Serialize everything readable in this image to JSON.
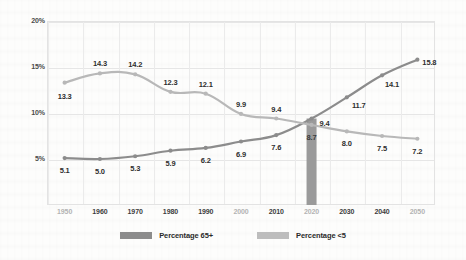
{
  "chart_data": {
    "type": "line",
    "title": "",
    "xlabel": "",
    "ylabel": "",
    "categories": [
      "1950",
      "1960",
      "1970",
      "1980",
      "1990",
      "2000",
      "2010",
      "2020",
      "2030",
      "2040",
      "2050"
    ],
    "series": [
      {
        "name": "Percentage 65+",
        "color": "#8c8c8c",
        "values": [
          5.1,
          5.0,
          5.3,
          5.9,
          6.2,
          6.9,
          7.6,
          9.4,
          11.7,
          14.1,
          15.8
        ]
      },
      {
        "name": "Percentage <5",
        "color": "#b8b8b8",
        "values": [
          13.3,
          14.3,
          14.2,
          12.3,
          12.1,
          9.9,
          9.4,
          8.7,
          8.0,
          7.5,
          7.2
        ]
      }
    ],
    "ylim": [
      0,
      20
    ],
    "yticks": [
      20,
      15,
      10,
      5
    ],
    "ytick_labels": [
      "20%",
      "15%",
      "10%",
      "5%"
    ],
    "grid": true,
    "legend_position": "bottom",
    "crossover_marker": {
      "category": "2020",
      "top_value": 9.4,
      "bar_label": "8.7",
      "color": "#9a9a9a"
    }
  },
  "axis": {
    "y_labels": [
      "20%",
      "15%",
      "10%",
      "5%"
    ],
    "x_labels": [
      {
        "text": "1950",
        "emphasis": "light"
      },
      {
        "text": "1960",
        "emphasis": "dark"
      },
      {
        "text": "1970",
        "emphasis": "dark"
      },
      {
        "text": "1980",
        "emphasis": "dark"
      },
      {
        "text": "1990",
        "emphasis": "dark"
      },
      {
        "text": "2000",
        "emphasis": "light"
      },
      {
        "text": "2010",
        "emphasis": "dark"
      },
      {
        "text": "2020",
        "emphasis": "light"
      },
      {
        "text": "2030",
        "emphasis": "dark"
      },
      {
        "text": "2040",
        "emphasis": "dark"
      },
      {
        "text": "2050",
        "emphasis": "light"
      }
    ]
  },
  "labels": {
    "series_65plus": [
      "5.1",
      "5.0",
      "5.3",
      "5.9",
      "6.2",
      "6.9",
      "7.6",
      "9.4",
      "11.7",
      "14.1",
      "15.8"
    ],
    "series_under5": [
      "13.3",
      "14.3",
      "14.2",
      "12.3",
      "12.1",
      "9.9",
      "9.4",
      "8.7",
      "8.0",
      "7.5",
      "7.2"
    ]
  },
  "legend": {
    "items": [
      {
        "label": "Percentage 65+",
        "color": "#8c8c8c"
      },
      {
        "label": "Percentage <5",
        "color": "#bdbdbd"
      }
    ]
  },
  "colors": {
    "line_65plus": "#8c8c8c",
    "line_under5": "#bcbcbc",
    "grid": "#e6e6e6",
    "frame": "#e3e3e3",
    "text": "#2e2e2e",
    "text_muted": "#b3b3b3",
    "background": "#fdfdfc"
  }
}
